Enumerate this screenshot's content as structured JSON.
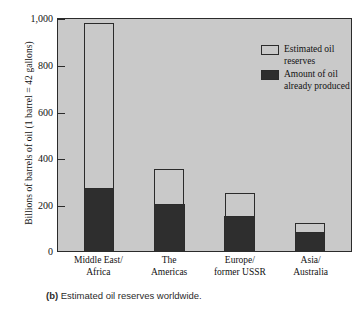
{
  "chart_data": {
    "type": "bar",
    "title": "",
    "subtitle": "",
    "xlabel": "",
    "ylabel": "Billions of barrels of oil (1 barrel = 42 gallons)",
    "ylim": [
      0,
      1000
    ],
    "yticks": [
      0,
      200,
      400,
      600,
      800,
      1000
    ],
    "ytick_labels": [
      "0",
      "200",
      "400",
      "600",
      "800",
      "1,000"
    ],
    "grid": false,
    "stacked": true,
    "legend_position": "top-right",
    "categories": [
      "Middle East/ Africa",
      "The Americas",
      "Europe/ former USSR",
      "Asia/ Australia"
    ],
    "series": [
      {
        "name": "Estimated oil reserves",
        "color": "#c9c9c9",
        "values": [
          975,
          350,
          250,
          120
        ]
      },
      {
        "name": "Amount of oil already produced",
        "color": "#2e2e2e",
        "values": [
          270,
          200,
          150,
          80
        ]
      }
    ],
    "annotations": []
  },
  "axis": {
    "y_title": "Billions of barrels of oil (1 barrel = 42 gallons)",
    "ticks": [
      {
        "value": 1000,
        "label": "1,000"
      },
      {
        "value": 800,
        "label": "800"
      },
      {
        "value": 600,
        "label": "600"
      },
      {
        "value": 400,
        "label": "400"
      },
      {
        "value": 200,
        "label": "200"
      },
      {
        "value": 0,
        "label": "0"
      }
    ]
  },
  "categories": [
    {
      "line1": "Middle East/",
      "line2": "Africa"
    },
    {
      "line1": "The",
      "line2": "Americas"
    },
    {
      "line1": "Europe/",
      "line2": "former USSR"
    },
    {
      "line1": "Asia/",
      "line2": "Australia"
    }
  ],
  "legend": {
    "items": [
      {
        "label": "Estimated oil reserves",
        "color": "#c9c9c9"
      },
      {
        "label": "Amount of oil already produced",
        "color": "#2e2e2e"
      }
    ]
  },
  "caption": {
    "tag": "(b)",
    "text": "Estimated oil reserves worldwide."
  }
}
